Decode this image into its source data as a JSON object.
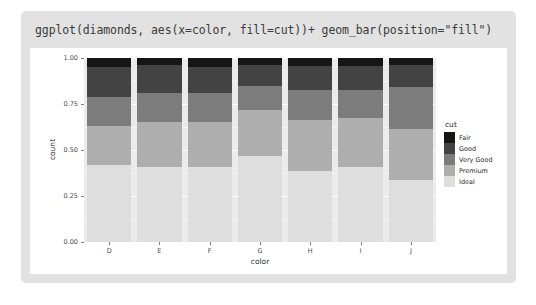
{
  "title": "ggplot(diamonds, aes(x=color, fill=cut))+ geom_bar(position=\"fill\")",
  "legend": {
    "title": "cut",
    "entries": [
      {
        "label": "Fair",
        "color": "#161616"
      },
      {
        "label": "Good",
        "color": "#434343"
      },
      {
        "label": "Very Good",
        "color": "#7c7c7c"
      },
      {
        "label": "Premium",
        "color": "#aeaeae"
      },
      {
        "label": "Ideal",
        "color": "#dedede"
      }
    ]
  },
  "chart_data": {
    "type": "bar",
    "title": "ggplot(diamonds, aes(x=color, fill=cut))+ geom_bar(position=\"fill\")",
    "xlabel": "color",
    "ylabel": "count",
    "stacked": true,
    "position": "fill",
    "ylim": [
      0,
      1
    ],
    "ytick_labels": [
      "0.00",
      "0.25",
      "0.50",
      "0.75",
      "1.00"
    ],
    "ytick_values": [
      0.0,
      0.25,
      0.5,
      0.75,
      1.0
    ],
    "grid": true,
    "legend_position": "right",
    "categories": [
      "D",
      "E",
      "F",
      "G",
      "H",
      "I",
      "J"
    ],
    "series": [
      {
        "name": "Ideal",
        "color": "#dedede",
        "values": [
          0.42,
          0.41,
          0.41,
          0.465,
          0.385,
          0.41,
          0.335
        ]
      },
      {
        "name": "Premium",
        "color": "#aeaeae",
        "values": [
          0.21,
          0.24,
          0.24,
          0.25,
          0.28,
          0.265,
          0.28
        ]
      },
      {
        "name": "Very Good",
        "color": "#7c7c7c",
        "values": [
          0.16,
          0.16,
          0.16,
          0.135,
          0.16,
          0.15,
          0.23
        ]
      },
      {
        "name": "Good",
        "color": "#434343",
        "values": [
          0.16,
          0.15,
          0.14,
          0.11,
          0.13,
          0.13,
          0.115
        ]
      },
      {
        "name": "Fair",
        "color": "#161616",
        "values": [
          0.05,
          0.04,
          0.05,
          0.04,
          0.045,
          0.045,
          0.04
        ]
      }
    ]
  },
  "panel": {
    "background_color": "#ebebeb",
    "card_color": "#e2e2e2",
    "plot_background": "#ffffff"
  }
}
